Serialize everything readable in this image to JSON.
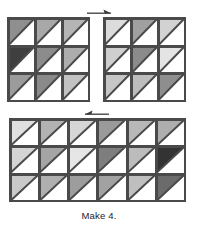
{
  "figure": {
    "caption": "Make 4.",
    "background_color": "#ffffff",
    "outline_color": "#4a4a4a",
    "unit_type": "half-square-triangle",
    "triangle_orientation": "upper-left",
    "blocks": [
      {
        "name": "block-top-left",
        "rows": 3,
        "cols": 3,
        "shades": [
          [
            "#8f8f8f",
            "#a8a8a8",
            "#b5b5b5"
          ],
          [
            "#3f3f3f",
            "#8c8c8c",
            "#adadad"
          ],
          [
            "#9b9b9b",
            "#8a8a8a",
            "#c2c2c2"
          ]
        ]
      },
      {
        "name": "block-top-right",
        "rows": 3,
        "cols": 3,
        "shades": [
          [
            "#dcdcdc",
            "#a0a0a0",
            "#d2d2d2"
          ],
          [
            "#cfcfcf",
            "#8b8b8b",
            "#e4e4e4"
          ],
          [
            "#c6c6c6",
            "#bdbdbd",
            "#8e8e8e"
          ]
        ]
      },
      {
        "name": "block-bottom",
        "rows": 3,
        "cols": 6,
        "shades": [
          [
            "#e0e0e0",
            "#b3b3b3",
            "#d6d6d6",
            "#9a9a9a",
            "#b8b8b8",
            "#aeaeae"
          ],
          [
            "#d4d4d4",
            "#a5a5a5",
            "#e6e6e6",
            "#7e7e7e",
            "#bcbcbc",
            "#333333"
          ],
          [
            "#c9c9c9",
            "#b0b0b0",
            "#9d9d9d",
            "#a2a2a2",
            "#bfbfbf",
            "#6b6b6b"
          ]
        ]
      }
    ],
    "arrows": [
      {
        "name": "arrow-top",
        "direction": "right"
      },
      {
        "name": "arrow-middle",
        "direction": "left"
      }
    ]
  }
}
